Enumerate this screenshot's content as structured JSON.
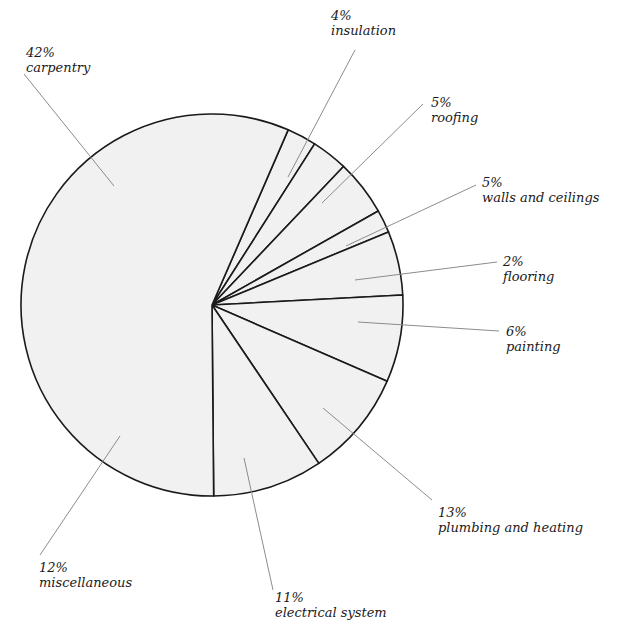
{
  "chart_data": {
    "type": "pie",
    "title": "",
    "center": [
      212,
      305
    ],
    "radius": 191,
    "colors": {
      "fill": "#f1f1f1",
      "stroke": "#1a1a1a",
      "leader": "#8c8c8c",
      "background": "#ffffff"
    },
    "slices": [
      {
        "label": "insulation",
        "value": 4,
        "pct_text": "4%",
        "start_angle": 23.5,
        "end_angle": 32.5,
        "label_pos": [
          331,
          8
        ],
        "leader": [
          [
            355,
            50
          ],
          [
            288,
            177
          ]
        ]
      },
      {
        "label": "roofing",
        "value": 5,
        "pct_text": "5%",
        "start_angle": 32.5,
        "end_angle": 43.5,
        "label_pos": [
          431,
          95
        ],
        "leader": [
          [
            423,
            104
          ],
          [
            322,
            203
          ]
        ]
      },
      {
        "label": "walls and ceilings",
        "value": 5,
        "pct_text": "5%",
        "start_angle": 43.5,
        "end_angle": 60.5,
        "label_pos": [
          482,
          175
        ],
        "leader": [
          [
            476,
            185
          ],
          [
            346,
            246
          ]
        ]
      },
      {
        "label": "flooring",
        "value": 2,
        "pct_text": "2%",
        "start_angle": 60.5,
        "end_angle": 67.5,
        "label_pos": [
          503,
          254
        ],
        "leader": [
          [
            497,
            262
          ],
          [
            355,
            280
          ]
        ]
      },
      {
        "label": "painting",
        "value": 6,
        "pct_text": "6%",
        "start_angle": 67.5,
        "end_angle": 87.0,
        "label_pos": [
          506,
          324
        ],
        "leader": [
          [
            499,
            331
          ],
          [
            358,
            322
          ]
        ]
      },
      {
        "label": "plumbing and heating",
        "value": 13,
        "pct_text": "13%",
        "start_angle": 87.0,
        "end_angle": 113.5,
        "label_pos": [
          438,
          505
        ],
        "leader": [
          [
            432,
            500
          ],
          [
            323,
            408
          ]
        ]
      },
      {
        "label": "electrical system",
        "value": 11,
        "pct_text": "11%",
        "start_angle": 113.5,
        "end_angle": 146.0,
        "label_pos": [
          275,
          590
        ],
        "leader": [
          [
            273,
            590
          ],
          [
            244,
            458
          ]
        ]
      },
      {
        "label": "miscellaneous",
        "value": 12,
        "pct_text": "12%",
        "start_angle": 146.0,
        "end_angle": 179.5,
        "label_pos": [
          39,
          560
        ],
        "leader": [
          [
            40,
            555
          ],
          [
            120,
            436
          ]
        ]
      },
      {
        "label": "carpentry",
        "value": 42,
        "pct_text": "42%",
        "start_angle": 179.5,
        "end_angle": 383.5,
        "label_pos": [
          26,
          45
        ],
        "leader": [
          [
            24,
            74
          ],
          [
            114,
            186
          ]
        ]
      }
    ]
  }
}
